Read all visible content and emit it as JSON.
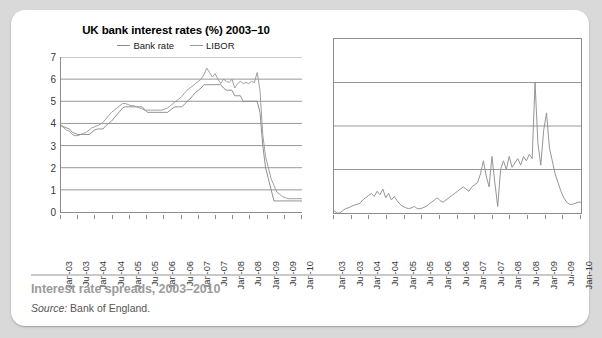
{
  "figure": {
    "caption": "Interest rate spreads, 2003–2010",
    "source_label": "Source:",
    "source_value": "Bank of England."
  },
  "chart_data": [
    {
      "id": "uk-bank-interest-rates",
      "type": "line",
      "title": "UK bank interest rates (%) 2003–10",
      "xlabel": "",
      "ylabel": "",
      "ylim": [
        0,
        7
      ],
      "yticks": [
        0,
        1,
        2,
        3,
        4,
        5,
        6,
        7
      ],
      "grid": true,
      "legend_position": "top-center",
      "x": [
        "Jan-03",
        "Jul-03",
        "Jan-04",
        "Jul-04",
        "Jan-05",
        "Jul-05",
        "Jan-06",
        "Jul-06",
        "Jan-07",
        "Jul-07",
        "Jan-08",
        "Jul-08",
        "Jan-09",
        "Jul-09",
        "Jan-10"
      ],
      "series": [
        {
          "name": "Bank rate",
          "color": "#8a8a8a",
          "values": [
            3.9,
            3.85,
            3.8,
            3.75,
            3.6,
            3.55,
            3.5,
            3.5,
            3.5,
            3.5,
            3.5,
            3.6,
            3.7,
            3.75,
            3.75,
            3.75,
            3.9,
            4.0,
            4.1,
            4.25,
            4.4,
            4.55,
            4.7,
            4.75,
            4.75,
            4.75,
            4.75,
            4.75,
            4.75,
            4.75,
            4.6,
            4.5,
            4.5,
            4.5,
            4.5,
            4.5,
            4.5,
            4.5,
            4.5,
            4.6,
            4.7,
            4.75,
            4.75,
            4.75,
            4.85,
            5.0,
            5.1,
            5.25,
            5.4,
            5.5,
            5.6,
            5.75,
            5.75,
            5.75,
            5.75,
            5.75,
            5.75,
            5.75,
            5.6,
            5.5,
            5.5,
            5.5,
            5.25,
            5.25,
            5.25,
            5.0,
            5.0,
            5.0,
            5.0,
            5.0,
            5.0,
            4.5,
            3.0,
            2.0,
            1.5,
            1.0,
            0.5,
            0.5,
            0.5,
            0.5,
            0.5,
            0.5,
            0.5,
            0.5,
            0.5,
            0.5,
            0.5
          ]
        },
        {
          "name": "LIBOR",
          "color": "#9a9a9a",
          "values": [
            3.95,
            3.8,
            3.7,
            3.65,
            3.5,
            3.45,
            3.45,
            3.5,
            3.55,
            3.6,
            3.7,
            3.8,
            3.85,
            3.9,
            3.95,
            4.05,
            4.2,
            4.35,
            4.5,
            4.6,
            4.7,
            4.8,
            4.9,
            4.9,
            4.85,
            4.8,
            4.8,
            4.75,
            4.7,
            4.65,
            4.6,
            4.6,
            4.6,
            4.6,
            4.6,
            4.6,
            4.6,
            4.65,
            4.7,
            4.8,
            4.9,
            5.0,
            5.1,
            5.2,
            5.35,
            5.5,
            5.6,
            5.7,
            5.8,
            5.9,
            6.0,
            6.2,
            6.5,
            6.3,
            6.1,
            6.25,
            6.0,
            5.8,
            6.0,
            5.9,
            5.85,
            6.0,
            5.6,
            5.8,
            5.9,
            5.8,
            5.85,
            5.8,
            5.9,
            5.85,
            6.3,
            5.5,
            3.5,
            2.5,
            2.0,
            1.5,
            1.2,
            0.9,
            0.8,
            0.7,
            0.65,
            0.6,
            0.6,
            0.6,
            0.6,
            0.6,
            0.6
          ]
        }
      ]
    },
    {
      "id": "interest-rate-spread",
      "type": "line",
      "title": "",
      "xlabel": "",
      "ylabel": "",
      "ylim": [
        0,
        4
      ],
      "yticks_visible": false,
      "gridlines": 4,
      "grid": true,
      "x": [
        "Jan-03",
        "Jul-03",
        "Jan-04",
        "Jul-04",
        "Jan-05",
        "Jul-05",
        "Jan-06",
        "Jul-06",
        "Jan-07",
        "Jul-07",
        "Jan-08",
        "Jul-08",
        "Jan-09",
        "Jul-09",
        "Jan-10"
      ],
      "series": [
        {
          "name": "LIBOR minus Bank rate spread",
          "color": "#8f8f8f",
          "values": [
            0.05,
            0.0,
            0.0,
            0.05,
            0.1,
            0.12,
            0.15,
            0.18,
            0.2,
            0.22,
            0.3,
            0.35,
            0.4,
            0.45,
            0.38,
            0.5,
            0.42,
            0.55,
            0.35,
            0.45,
            0.3,
            0.38,
            0.28,
            0.2,
            0.15,
            0.12,
            0.1,
            0.12,
            0.15,
            0.1,
            0.1,
            0.12,
            0.15,
            0.2,
            0.25,
            0.3,
            0.35,
            0.28,
            0.25,
            0.3,
            0.35,
            0.4,
            0.45,
            0.5,
            0.55,
            0.6,
            0.55,
            0.5,
            0.6,
            0.65,
            0.7,
            0.9,
            1.2,
            0.85,
            0.6,
            1.3,
            0.7,
            0.15,
            1.0,
            1.2,
            1.0,
            1.3,
            1.05,
            1.15,
            1.25,
            1.1,
            1.3,
            1.2,
            1.35,
            1.25,
            3.0,
            1.6,
            1.1,
            1.9,
            2.3,
            1.5,
            1.2,
            0.9,
            0.7,
            0.5,
            0.35,
            0.25,
            0.2,
            0.2,
            0.22,
            0.25,
            0.25
          ]
        }
      ]
    }
  ]
}
